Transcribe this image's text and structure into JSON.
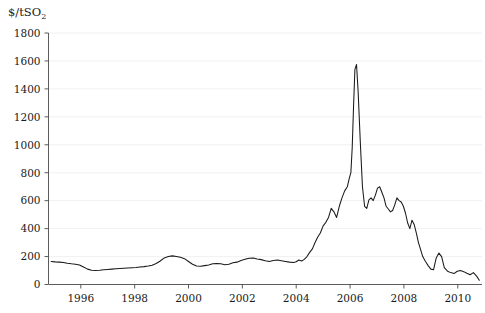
{
  "chart_data": {
    "type": "line",
    "title": "",
    "subtitle": "",
    "ylabel": "$/tSO2",
    "ylabel_base": "$/tSO",
    "ylabel_sub": "2",
    "xlabel": "",
    "grid": true,
    "legend": "none",
    "xlim": [
      1994.8,
      2010.9
    ],
    "ylim": [
      0,
      1800
    ],
    "yticks": [
      0,
      200,
      400,
      600,
      800,
      1000,
      1200,
      1400,
      1600,
      1800
    ],
    "xticks": [
      1996,
      1998,
      2000,
      2002,
      2004,
      2006,
      2008,
      2010
    ],
    "xtick_labels": [
      "1996",
      "1998",
      "2000",
      "2002",
      "2004",
      "2006",
      "2008",
      "2010"
    ],
    "ytick_labels": [
      "0",
      "200",
      "400",
      "600",
      "800",
      "1000",
      "1200",
      "1400",
      "1600",
      "1800"
    ],
    "series": [
      {
        "name": "SO2 allowance price",
        "color": "#1a1a1a",
        "x": [
          1994.9,
          1995.05,
          1995.2,
          1995.35,
          1995.5,
          1995.65,
          1995.8,
          1995.95,
          1996.1,
          1996.25,
          1996.4,
          1996.55,
          1996.7,
          1996.85,
          1997.0,
          1997.15,
          1997.3,
          1997.45,
          1997.6,
          1997.75,
          1997.9,
          1998.05,
          1998.2,
          1998.35,
          1998.5,
          1998.65,
          1998.8,
          1998.95,
          1999.1,
          1999.25,
          1999.4,
          1999.55,
          1999.7,
          1999.85,
          2000.0,
          2000.15,
          2000.3,
          2000.45,
          2000.6,
          2000.75,
          2000.9,
          2001.05,
          2001.2,
          2001.35,
          2001.5,
          2001.65,
          2001.8,
          2001.95,
          2002.1,
          2002.25,
          2002.4,
          2002.55,
          2002.7,
          2002.85,
          2003.0,
          2003.15,
          2003.3,
          2003.45,
          2003.6,
          2003.75,
          2003.9,
          2004.0,
          2004.1,
          2004.2,
          2004.3,
          2004.4,
          2004.5,
          2004.6,
          2004.7,
          2004.8,
          2004.9,
          2005.0,
          2005.1,
          2005.2,
          2005.3,
          2005.4,
          2005.5,
          2005.6,
          2005.7,
          2005.8,
          2005.9,
          2005.97,
          2006.03,
          2006.08,
          2006.13,
          2006.18,
          2006.24,
          2006.3,
          2006.38,
          2006.46,
          2006.54,
          2006.62,
          2006.7,
          2006.78,
          2006.86,
          2006.94,
          2007.02,
          2007.1,
          2007.18,
          2007.26,
          2007.34,
          2007.42,
          2007.5,
          2007.58,
          2007.66,
          2007.74,
          2007.82,
          2007.9,
          2007.98,
          2008.06,
          2008.14,
          2008.22,
          2008.3,
          2008.38,
          2008.46,
          2008.54,
          2008.62,
          2008.7,
          2008.8,
          2008.9,
          2009.0,
          2009.1,
          2009.2,
          2009.3,
          2009.4,
          2009.5,
          2009.62,
          2009.74,
          2009.86,
          2009.98,
          2010.1,
          2010.22,
          2010.34,
          2010.46,
          2010.58,
          2010.7,
          2010.8
        ],
        "y": [
          165,
          162,
          160,
          158,
          152,
          148,
          145,
          140,
          125,
          110,
          102,
          100,
          102,
          105,
          108,
          110,
          112,
          114,
          116,
          118,
          120,
          122,
          125,
          128,
          132,
          138,
          150,
          168,
          190,
          200,
          205,
          200,
          195,
          185,
          165,
          145,
          133,
          130,
          135,
          140,
          148,
          150,
          148,
          142,
          145,
          155,
          160,
          172,
          180,
          188,
          190,
          182,
          178,
          170,
          165,
          172,
          175,
          170,
          165,
          160,
          158,
          163,
          175,
          168,
          180,
          200,
          230,
          255,
          300,
          340,
          370,
          420,
          445,
          480,
          545,
          520,
          480,
          560,
          620,
          670,
          700,
          760,
          800,
          980,
          1280,
          1540,
          1575,
          1380,
          1020,
          700,
          560,
          545,
          605,
          620,
          600,
          640,
          690,
          700,
          660,
          620,
          560,
          540,
          520,
          530,
          570,
          620,
          600,
          590,
          560,
          510,
          440,
          400,
          460,
          430,
          370,
          300,
          250,
          200,
          165,
          135,
          110,
          105,
          190,
          225,
          200,
          120,
          95,
          85,
          78,
          95,
          100,
          92,
          80,
          70,
          85,
          60,
          30
        ]
      }
    ]
  }
}
